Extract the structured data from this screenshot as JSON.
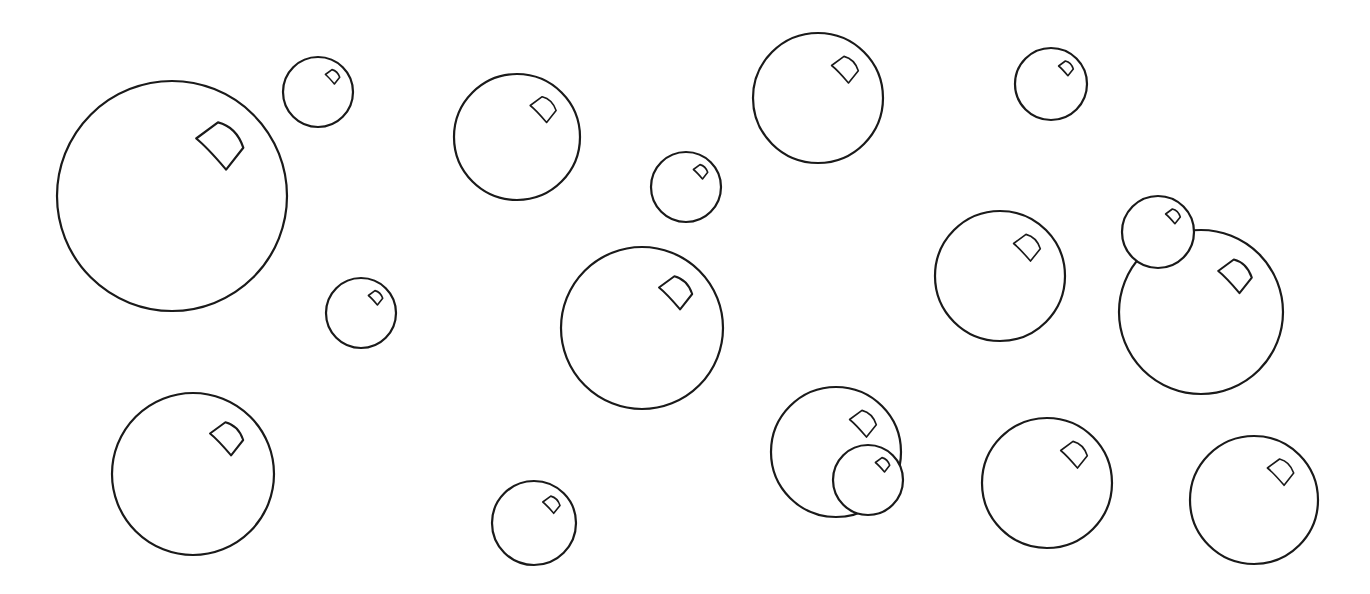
{
  "scene": {
    "width": 1370,
    "height": 594,
    "background": "#ffffff",
    "line_color": "#1a1a1a",
    "line_width": 2.2,
    "description": "Line-art illustration of soap bubbles with small curved highlight glints"
  },
  "bubbles": [
    {
      "id": "bubble-1",
      "cx": 172,
      "cy": 196,
      "r": 115
    },
    {
      "id": "bubble-2",
      "cx": 318,
      "cy": 92,
      "r": 35
    },
    {
      "id": "bubble-3",
      "cx": 361,
      "cy": 313,
      "r": 35
    },
    {
      "id": "bubble-4",
      "cx": 517,
      "cy": 137,
      "r": 63
    },
    {
      "id": "bubble-5",
      "cx": 686,
      "cy": 187,
      "r": 35
    },
    {
      "id": "bubble-6",
      "cx": 818,
      "cy": 98,
      "r": 65
    },
    {
      "id": "bubble-7",
      "cx": 1051,
      "cy": 84,
      "r": 36
    },
    {
      "id": "bubble-8",
      "cx": 642,
      "cy": 328,
      "r": 81
    },
    {
      "id": "bubble-9",
      "cx": 1000,
      "cy": 276,
      "r": 65
    },
    {
      "id": "bubble-10",
      "cx": 1201,
      "cy": 312,
      "r": 82
    },
    {
      "id": "bubble-11",
      "cx": 1158,
      "cy": 232,
      "r": 36
    },
    {
      "id": "bubble-12",
      "cx": 193,
      "cy": 474,
      "r": 81
    },
    {
      "id": "bubble-13",
      "cx": 534,
      "cy": 523,
      "r": 42
    },
    {
      "id": "bubble-14",
      "cx": 836,
      "cy": 452,
      "r": 65
    },
    {
      "id": "bubble-15",
      "cx": 868,
      "cy": 480,
      "r": 35
    },
    {
      "id": "bubble-16",
      "cx": 1047,
      "cy": 483,
      "r": 65
    },
    {
      "id": "bubble-17",
      "cx": 1254,
      "cy": 500,
      "r": 64
    }
  ],
  "highlight_shape": {
    "left": [
      0.21,
      -0.5
    ],
    "top": [
      0.4,
      -0.64
    ],
    "right": [
      0.62,
      -0.42
    ],
    "bottom": [
      0.47,
      -0.23
    ]
  }
}
